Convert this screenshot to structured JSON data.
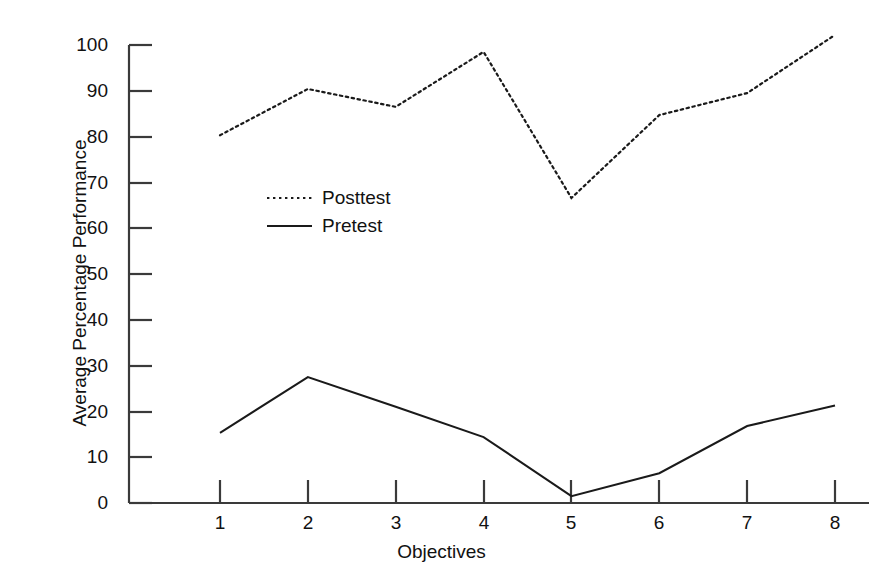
{
  "chart_data": {
    "type": "line",
    "title": "",
    "xlabel": "Objectives",
    "ylabel": "Average Percentage Performance",
    "categories": [
      "1",
      "2",
      "3",
      "4",
      "5",
      "6",
      "7",
      "8"
    ],
    "x": [
      1,
      2,
      3,
      4,
      5,
      6,
      7,
      8
    ],
    "xlim": [
      1,
      8
    ],
    "ylim": [
      0,
      100
    ],
    "yticks": [
      "0",
      "10",
      "20",
      "30",
      "40",
      "50",
      "60",
      "70",
      "80",
      "90",
      "100"
    ],
    "ytick_values": [
      0,
      10,
      20,
      30,
      40,
      50,
      60,
      70,
      80,
      90,
      100
    ],
    "grid": false,
    "legend_position": "inside-upper-left",
    "series": [
      {
        "name": "Posttest",
        "style": "dotted",
        "color": "#1a1a1a",
        "values": [
          80.3,
          90.4,
          86.5,
          98.5,
          66.6,
          84.7,
          89.5,
          102.2
        ]
      },
      {
        "name": "Pretest",
        "style": "solid",
        "color": "#1a1a1a",
        "values": [
          15.3,
          27.5,
          21.0,
          14.4,
          1.5,
          6.5,
          16.8,
          21.3
        ]
      }
    ]
  },
  "axes": {
    "y_title": "Average Percentage Performance",
    "x_title": "Objectives"
  },
  "legend": {
    "entries": [
      {
        "label": "Posttest",
        "style": "dotted"
      },
      {
        "label": "Pretest",
        "style": "solid"
      }
    ]
  },
  "colors": {
    "axis": "#3a3a3a",
    "series": "#1a1a1a",
    "background": "#ffffff"
  }
}
